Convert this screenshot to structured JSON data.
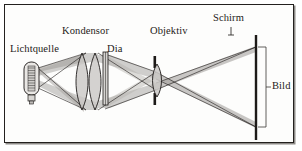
{
  "figure": {
    "background_color": "#ffffff",
    "frame_color": "#23201e",
    "frame_shadow_color": "#8e8b88",
    "ray_fill_color": "#a9a6a3",
    "ray_line_color": "#1d1a18",
    "glass_fill_color": "#c9c7c4",
    "labels": {
      "light_source": "Lichtquelle",
      "condenser": "Kondensor",
      "slide": "Dia",
      "objective": "Objektiv",
      "screen": "Schirm",
      "image": "Bild"
    },
    "components": [
      {
        "name": "light-source",
        "label": "Lichtquelle",
        "x": 31,
        "y": 78
      },
      {
        "name": "condenser",
        "label": "Kondensor",
        "x": 88,
        "y": 81
      },
      {
        "name": "slide",
        "label": "Dia",
        "x": 105,
        "y": 79
      },
      {
        "name": "objective",
        "label": "Objektiv",
        "x": 157,
        "y": 81
      },
      {
        "name": "screen",
        "label": "Schirm",
        "x": 256,
        "y": 88
      }
    ]
  }
}
